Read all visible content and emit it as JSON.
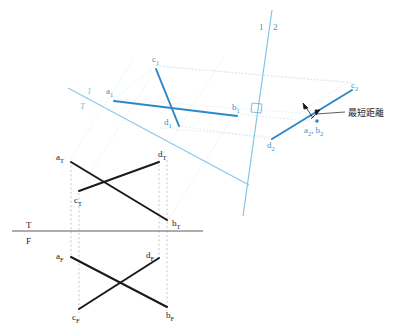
{
  "figure": {
    "annotation_text": "最短距離",
    "colors": {
      "line_dark": "#1a1a1a",
      "line_blue": "#2e88c6",
      "fold_blue": "#7dbde4",
      "projector_gray": "#9a9a9a",
      "projector_light_blue": "#cde4f3",
      "label_dark": "#1a1a1a",
      "label_blue": "#3a8fcc"
    }
  },
  "fold_lines": {
    "tf": {
      "top_label": "T",
      "bottom_label": "F"
    },
    "t1": {
      "upper_label": "1",
      "lower_label": "T"
    },
    "one_two": {
      "left_label": "1",
      "right_label": "2"
    }
  },
  "views": {
    "top_view": {
      "name": "Top view (T)",
      "points": [
        {
          "id": "a_T",
          "base": "a",
          "sub": "T",
          "x": 70,
          "y": 160
        },
        {
          "id": "c_T",
          "base": "c",
          "sub": "T",
          "x": 77,
          "y": 194
        },
        {
          "id": "d_T",
          "base": "d",
          "sub": "T",
          "x": 159,
          "y": 159
        },
        {
          "id": "b_T",
          "base": "b",
          "sub": "T",
          "x": 167,
          "y": 222
        }
      ],
      "segments": [
        {
          "from": "a_T",
          "to": "b_T"
        },
        {
          "from": "c_T",
          "to": "d_T"
        }
      ]
    },
    "front_view": {
      "name": "Front view (F)",
      "points": [
        {
          "id": "a_F",
          "base": "a",
          "sub": "F",
          "x": 70,
          "y": 255
        },
        {
          "id": "d_F",
          "base": "d",
          "sub": "F",
          "x": 151,
          "y": 256
        },
        {
          "id": "c_F",
          "base": "c",
          "sub": "F",
          "x": 77,
          "y": 311
        },
        {
          "id": "b_F",
          "base": "b",
          "sub": "F",
          "x": 167,
          "y": 309
        }
      ],
      "segments": [
        {
          "from": "a_F",
          "to": "b_F"
        },
        {
          "from": "c_F",
          "to": "d_F"
        }
      ]
    },
    "aux_view_1": {
      "name": "Auxiliary view 1",
      "points": [
        {
          "id": "a_1",
          "base": "a",
          "sub": "1",
          "x": 115,
          "y": 99
        },
        {
          "id": "b_1",
          "base": "b",
          "sub": "1",
          "x": 237,
          "y": 114
        },
        {
          "id": "c_1",
          "base": "c",
          "sub": "1",
          "x": 156,
          "y": 66
        },
        {
          "id": "d_1",
          "base": "d",
          "sub": "1",
          "x": 178,
          "y": 126
        }
      ],
      "segments": [
        {
          "from": "a_1",
          "to": "b_1"
        },
        {
          "from": "c_1",
          "to": "d_1"
        }
      ]
    },
    "aux_view_2": {
      "name": "Auxiliary view 2 (point view of AB)",
      "points": [
        {
          "id": "d_2",
          "base": "d",
          "sub": "2",
          "x": 273,
          "y": 140
        },
        {
          "id": "c_2",
          "base": "c",
          "sub": "2",
          "x": 355,
          "y": 89
        },
        {
          "id": "ab_2",
          "label": "a₂, b₂",
          "base": "a",
          "sub": "2",
          "base2": "b",
          "sub2": "2",
          "x": 318,
          "y": 123
        }
      ],
      "segments": [
        {
          "from": "d_2",
          "to": "c_2"
        }
      ],
      "point_view_marker": true
    }
  },
  "labels": {
    "a_T": "a",
    "a_T_sub": "T",
    "b_T": "b",
    "b_T_sub": "T",
    "c_T": "c",
    "c_T_sub": "T",
    "d_T": "d",
    "d_T_sub": "T",
    "a_F": "a",
    "a_F_sub": "F",
    "b_F": "b",
    "b_F_sub": "F",
    "c_F": "c",
    "c_F_sub": "F",
    "d_F": "d",
    "d_F_sub": "F",
    "a_1": "a",
    "a_1_sub": "1",
    "b_1": "b",
    "b_1_sub": "1",
    "c_1": "c",
    "c_1_sub": "1",
    "d_1": "d",
    "d_1_sub": "1",
    "c_2": "c",
    "c_2_sub": "2",
    "d_2": "d",
    "d_2_sub": "2",
    "a_2": "a",
    "a_2_sub": "2",
    "b_2": "b",
    "b_2_sub": "2",
    "comma": ",",
    "fold_T": "T",
    "fold_F": "F",
    "fold_1_left": "1",
    "fold_T_lower": "T",
    "fold_1": "1",
    "fold_2": "2",
    "shortest_distance": "最短距離"
  }
}
